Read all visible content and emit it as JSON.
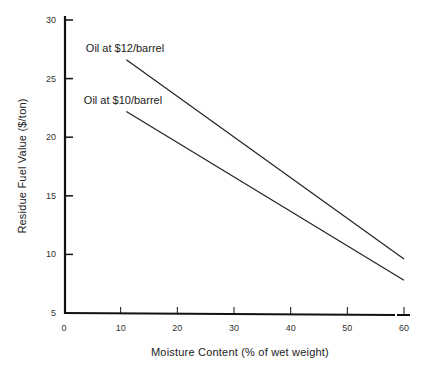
{
  "chart_data": {
    "type": "line",
    "title": "",
    "xlabel": "Moisture Content (% of wet weight)",
    "ylabel": "Residue Fuel Value ($/ton)",
    "xlim": [
      0,
      60
    ],
    "ylim": [
      5,
      30
    ],
    "xticks": [
      0,
      10,
      20,
      30,
      40,
      50,
      60
    ],
    "yticks": [
      5,
      10,
      15,
      20,
      25,
      30
    ],
    "grid": false,
    "legend": "inline labels near line starts",
    "series": [
      {
        "name": "Oil at $12/barrel",
        "x": [
          11,
          60
        ],
        "y": [
          26.6,
          9.6
        ]
      },
      {
        "name": "Oil at $10/barrel",
        "x": [
          11,
          60
        ],
        "y": [
          22.2,
          7.8
        ]
      }
    ]
  }
}
